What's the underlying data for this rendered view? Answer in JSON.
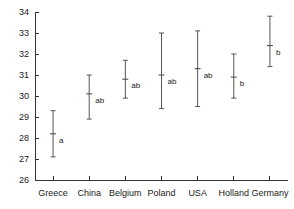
{
  "chart_data": {
    "type": "scatter",
    "title": "",
    "subtitle": "",
    "xlabel": "",
    "ylabel": "",
    "categories": [
      "Greece",
      "China",
      "Belgium",
      "Poland",
      "USA",
      "Holland",
      "Germany"
    ],
    "values": [
      28.2,
      30.1,
      30.8,
      31.0,
      31.3,
      30.9,
      32.4
    ],
    "lower": [
      27.1,
      28.9,
      29.9,
      29.4,
      29.5,
      29.9,
      31.4
    ],
    "upper": [
      29.3,
      31.0,
      31.7,
      33.0,
      33.1,
      32.0,
      33.8
    ],
    "point_labels": [
      "a",
      "ab",
      "ab",
      "ab",
      "ab",
      "b",
      "b"
    ],
    "ylim": [
      26,
      34
    ],
    "yticks": [
      26,
      27,
      28,
      29,
      30,
      31,
      32,
      33,
      34
    ],
    "ytick_labels": [
      "26",
      "27",
      "28",
      "29",
      "30",
      "31",
      "32",
      "33",
      "34"
    ],
    "grid": false,
    "legend": "none",
    "series": [
      {
        "name": "mean with confidence interval",
        "values": [
          28.2,
          30.1,
          30.8,
          31.0,
          31.3,
          30.9,
          32.4
        ]
      }
    ]
  },
  "style": {
    "axis_color": "#333333",
    "whisker_color": "#555555",
    "text_color": "#1a1a1a",
    "background": "#ffffff"
  }
}
